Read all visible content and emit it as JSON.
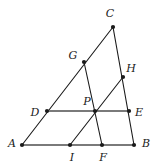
{
  "figure": {
    "kind": "euclidean-geometry-diagram",
    "width": 161,
    "height": 165,
    "background_color": "#ffffff",
    "stroke_color": "#1a1a1a",
    "highlight_stroke_color": "#7a7a7a",
    "point_color": "#1a1a1a",
    "points": [
      {
        "id": "A",
        "label": "A",
        "x": 22,
        "y": 145,
        "label_x": 12,
        "label_y": 143
      },
      {
        "id": "B",
        "label": "B",
        "x": 134,
        "y": 145,
        "label_x": 146,
        "label_y": 143
      },
      {
        "id": "C",
        "label": "C",
        "x": 113,
        "y": 27,
        "label_x": 110,
        "label_y": 13
      },
      {
        "id": "D",
        "label": "D",
        "x": 47,
        "y": 111,
        "label_x": 35,
        "label_y": 112
      },
      {
        "id": "E",
        "label": "E",
        "x": 129,
        "y": 111,
        "label_x": 139,
        "label_y": 112
      },
      {
        "id": "F",
        "label": "F",
        "x": 102,
        "y": 145,
        "label_x": 103,
        "label_y": 157
      },
      {
        "id": "G",
        "label": "G",
        "x": 84,
        "y": 62,
        "label_x": 73,
        "label_y": 55
      },
      {
        "id": "H",
        "label": "H",
        "x": 123,
        "y": 77,
        "label_x": 131,
        "label_y": 68
      },
      {
        "id": "I",
        "label": "I",
        "x": 70,
        "y": 145,
        "label_x": 72,
        "label_y": 157
      },
      {
        "id": "P",
        "label": "P",
        "x": 95,
        "y": 111,
        "label_x": 87,
        "label_y": 101
      }
    ],
    "segments": [
      {
        "id": "AC",
        "name": "side-ac",
        "from": "A",
        "to": "C",
        "style": "plain"
      },
      {
        "id": "CB",
        "name": "side-cb",
        "from": "C",
        "to": "B",
        "style": "plain"
      },
      {
        "id": "AB",
        "name": "side-ab",
        "from": "A",
        "to": "B",
        "style": "highlight"
      },
      {
        "id": "DE",
        "name": "transversal-de",
        "from": "D",
        "to": "E",
        "style": "highlight"
      },
      {
        "id": "GF",
        "name": "cevian-gf",
        "from": "G",
        "to": "F",
        "style": "plain"
      },
      {
        "id": "IH",
        "name": "cevian-ih",
        "from": "I",
        "to": "H",
        "style": "plain"
      }
    ],
    "on_segment_points": {
      "AC": [
        "D",
        "G"
      ],
      "CB": [
        "H",
        "E"
      ],
      "AB": [
        "I",
        "F"
      ],
      "DE": [
        "P"
      ],
      "GF": [
        "P"
      ],
      "IH": [
        "P"
      ]
    },
    "point_radius": 2.1,
    "stroke_width": 1.1,
    "highlight_stroke_width": 2.0
  }
}
